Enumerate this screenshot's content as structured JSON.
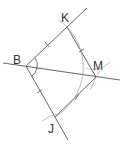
{
  "diagram": {
    "points": [
      {
        "name": "B",
        "label": "B",
        "x": 26,
        "y": 66
      },
      {
        "name": "K",
        "label": "K",
        "x": 67,
        "y": 27
      },
      {
        "name": "M",
        "label": "M",
        "x": 96,
        "y": 77
      },
      {
        "name": "J",
        "label": "J",
        "x": 55,
        "y": 117
      }
    ],
    "segments": [
      "BK",
      "BJ",
      "KM",
      "JM"
    ],
    "lines": [
      "ray through B and K",
      "ray through B and J",
      "bisector through B and M"
    ],
    "equal_marks": {
      "single_tick": [
        "BK",
        "BJ"
      ],
      "double_arc_tick": [
        "KM",
        "JM"
      ]
    },
    "angle_marks": [
      "angle KBM",
      "angle MBJ"
    ],
    "colors": {
      "line": "#555555",
      "construction_arc": "#aaaaaa",
      "label": "#333333"
    }
  }
}
